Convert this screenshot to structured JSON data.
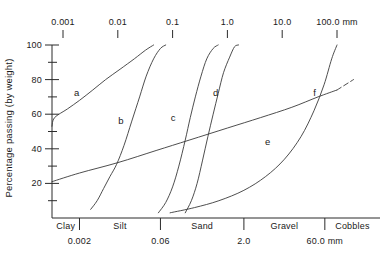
{
  "chart_data": {
    "type": "line",
    "title": "",
    "subtitle": "",
    "xlabel": "",
    "ylabel": "Percentage passing (by weight)",
    "x_scale": "log",
    "x_unit": "mm",
    "xlim": [
      0.0004,
      200
    ],
    "ylim": [
      0,
      100
    ],
    "grid": false,
    "legend_position": "inline-curve-labels",
    "top_axis": {
      "name": "particle-size-axis",
      "tick_labels": [
        "0.001",
        "0.01",
        "0.1",
        "1.0",
        "10.0",
        "100.0 mm"
      ],
      "tick_values": [
        0.001,
        0.01,
        0.1,
        1.0,
        10.0,
        100.0
      ]
    },
    "y_axis": {
      "name": "percentage-passing-axis",
      "tick_labels": [
        "20",
        "40",
        "60",
        "80",
        "100"
      ],
      "tick_values": [
        20,
        40,
        60,
        80,
        100
      ],
      "minor_tick_values": [
        10,
        30,
        50,
        70,
        90
      ]
    },
    "classification_axis": {
      "name": "soil-classification-axis",
      "classes": [
        "Clay",
        "Silt",
        "Sand",
        "Gravel",
        "Cobbles"
      ],
      "boundaries": [
        "0.002",
        "0.06",
        "2.0",
        "60.0 mm"
      ],
      "boundary_values": [
        0.002,
        0.06,
        2.0,
        60.0
      ]
    },
    "series": [
      {
        "name": "a",
        "label": "a",
        "style": "solid",
        "points": [
          [
            0.0004,
            53
          ],
          [
            0.0007,
            58
          ],
          [
            0.0012,
            63
          ],
          [
            0.002,
            68
          ],
          [
            0.0035,
            74
          ],
          [
            0.006,
            80
          ],
          [
            0.011,
            86
          ],
          [
            0.02,
            92
          ],
          [
            0.032,
            97
          ],
          [
            0.045,
            100
          ]
        ]
      },
      {
        "name": "b",
        "label": "b",
        "style": "solid",
        "points": [
          [
            0.0032,
            5
          ],
          [
            0.0042,
            10
          ],
          [
            0.0055,
            17
          ],
          [
            0.0072,
            24
          ],
          [
            0.0095,
            31
          ],
          [
            0.013,
            42
          ],
          [
            0.018,
            56
          ],
          [
            0.025,
            70
          ],
          [
            0.033,
            82
          ],
          [
            0.045,
            92
          ],
          [
            0.06,
            98
          ],
          [
            0.075,
            100
          ]
        ]
      },
      {
        "name": "c",
        "label": "c",
        "style": "solid",
        "points": [
          [
            0.055,
            3
          ],
          [
            0.075,
            9
          ],
          [
            0.1,
            18
          ],
          [
            0.13,
            30
          ],
          [
            0.17,
            45
          ],
          [
            0.21,
            58
          ],
          [
            0.26,
            70
          ],
          [
            0.33,
            82
          ],
          [
            0.42,
            92
          ],
          [
            0.55,
            98
          ],
          [
            0.68,
            100
          ]
        ]
      },
      {
        "name": "d",
        "label": "d",
        "style": "solid",
        "points": [
          [
            0.17,
            3
          ],
          [
            0.22,
            10
          ],
          [
            0.28,
            20
          ],
          [
            0.35,
            33
          ],
          [
            0.44,
            47
          ],
          [
            0.55,
            60
          ],
          [
            0.68,
            72
          ],
          [
            0.85,
            84
          ],
          [
            1.1,
            93
          ],
          [
            1.35,
            99
          ],
          [
            1.6,
            100
          ]
        ]
      },
      {
        "name": "e",
        "label": "e",
        "style": "solid-with-dashed-extension",
        "points": [
          [
            0.0004,
            21
          ],
          [
            0.002,
            26
          ],
          [
            0.01,
            32
          ],
          [
            0.05,
            39
          ],
          [
            0.2,
            45
          ],
          [
            1.0,
            52
          ],
          [
            4.0,
            58
          ],
          [
            15.0,
            64
          ],
          [
            45.0,
            70
          ],
          [
            100.0,
            74
          ]
        ],
        "dashed_extension": [
          [
            100.0,
            74
          ],
          [
            200.0,
            80
          ]
        ]
      },
      {
        "name": "f",
        "label": "f",
        "style": "solid",
        "points": [
          [
            0.09,
            3
          ],
          [
            0.25,
            6
          ],
          [
            0.7,
            10
          ],
          [
            2.0,
            16
          ],
          [
            5.0,
            24
          ],
          [
            11.0,
            34
          ],
          [
            22.0,
            47
          ],
          [
            38.0,
            62
          ],
          [
            58.0,
            77
          ],
          [
            80.0,
            92
          ],
          [
            100.0,
            100
          ]
        ]
      }
    ],
    "curve_label_positions": [
      {
        "name": "a",
        "x": 0.0018,
        "y": 72
      },
      {
        "name": "b",
        "x": 0.0115,
        "y": 56
      },
      {
        "name": "c",
        "x": 0.105,
        "y": 58
      },
      {
        "name": "d",
        "x": 0.62,
        "y": 72
      },
      {
        "name": "e",
        "x": 5.5,
        "y": 44
      },
      {
        "name": "f",
        "x": 42.0,
        "y": 72
      }
    ]
  }
}
